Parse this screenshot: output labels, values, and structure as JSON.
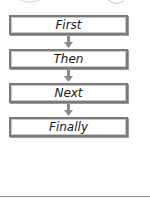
{
  "diagram": {
    "type": "sequence-flowchart",
    "steps": [
      {
        "label": "First"
      },
      {
        "label": "Then"
      },
      {
        "label": "Next"
      },
      {
        "label": "Finally"
      }
    ],
    "colors": {
      "box_border": "#7a7a7a",
      "box_fill": "#ffffff",
      "arrow": "#8a8a8a",
      "text": "#1a1a1a"
    }
  }
}
